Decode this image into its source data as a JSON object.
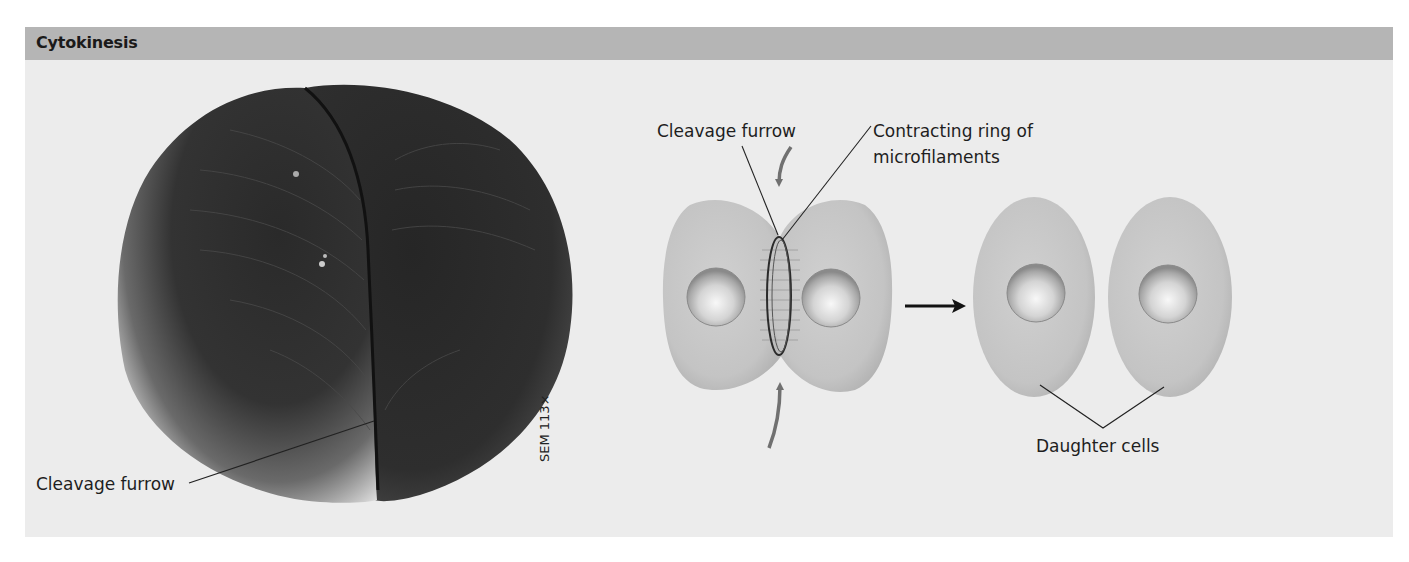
{
  "header": {
    "title": "Cytokinesis"
  },
  "micrograph": {
    "label": "Cleavage furrow",
    "scale_label": "SEM 113×"
  },
  "diagram": {
    "cleavage_furrow_label": "Cleavage furrow",
    "ring_label_line1": "Contracting ring of",
    "ring_label_line2": "microfilaments",
    "daughter_cells_label": "Daughter cells",
    "arrow_icon": "right-arrow-icon"
  },
  "colors": {
    "header_bg": "#b5b5b5",
    "panel_bg": "#ececec",
    "cell_fill": "#c6c6c6",
    "arrow_grey": "#707070",
    "text": "#1e1e1e"
  }
}
